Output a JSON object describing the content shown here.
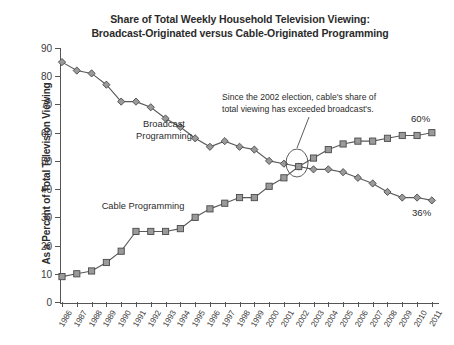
{
  "chart_data": {
    "type": "line",
    "title": "Share of Total Weekly Household Television Viewing: Broadcast-Originated versus Cable-Originated Programming",
    "title_line1": "Share of Total Weekly Household Television Viewing:",
    "title_line2": "Broadcast-Originated versus Cable-Originated Programming",
    "xlabel": "",
    "ylabel": "As a Percent of Total Television Viewing",
    "ylim": [
      0,
      90
    ],
    "ytick_step": 10,
    "yticks": [
      0,
      10,
      20,
      30,
      40,
      50,
      60,
      70,
      80,
      90
    ],
    "grid": false,
    "legend_position": "inline-labels",
    "categories": [
      "1986",
      "1987",
      "1988",
      "1989",
      "1990",
      "1991",
      "1992",
      "1993",
      "1994",
      "1995",
      "1996",
      "1997",
      "1998",
      "1999",
      "2000",
      "2001",
      "2002",
      "2003",
      "2004",
      "2005",
      "2006",
      "2007",
      "2008",
      "2009",
      "2010",
      "2011"
    ],
    "series": [
      {
        "name": "Broadcast Programming",
        "marker": "diamond",
        "values": [
          85,
          82,
          81,
          77,
          71,
          71,
          69,
          65,
          62,
          58,
          55,
          57,
          55,
          54,
          50,
          49,
          48,
          47,
          47,
          46,
          44,
          42,
          39,
          37,
          37,
          36
        ]
      },
      {
        "name": "Cable Programming",
        "marker": "square",
        "values": [
          9,
          10,
          11,
          14,
          18,
          25,
          25,
          25,
          26,
          30,
          33,
          35,
          37,
          37,
          41,
          44,
          48,
          51,
          54,
          56,
          57,
          57,
          58,
          59,
          59,
          60
        ]
      }
    ],
    "annotations": [
      {
        "id": "crossover-note",
        "text": "Since the 2002 election, cable's share of total viewing has exceeded broadcast's.",
        "line1": "Since the 2002 election, cable's share of",
        "line2": "total viewing has exceeded broadcast's.",
        "points_to_year": "2002"
      }
    ],
    "end_labels": [
      {
        "series": "Cable Programming",
        "text": "60%"
      },
      {
        "series": "Broadcast Programming",
        "text": "36%"
      }
    ],
    "colors": {
      "line": "#595959",
      "marker_fill": "#9a9a9a",
      "marker_stroke": "#4a4a4a",
      "text": "#2b2b2b",
      "axis": "#555555",
      "background": "#ffffff"
    }
  },
  "labels": {
    "broadcast_series_label_line1": "Broadcast",
    "broadcast_series_label_line2": "Programming",
    "cable_series_label": "Cable Programming"
  }
}
